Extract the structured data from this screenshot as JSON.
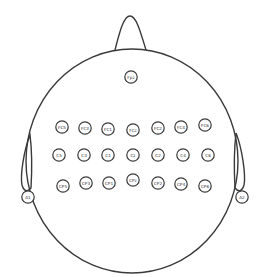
{
  "colors": {
    "stroke": "#3a3a3a",
    "background": "#ffffff"
  },
  "electrodes": [
    {
      "label": "Fpz",
      "x": 131,
      "y": 77
    },
    {
      "label": "FC5",
      "x": 62,
      "y": 127
    },
    {
      "label": "FC3",
      "x": 85,
      "y": 128
    },
    {
      "label": "FC1",
      "x": 108,
      "y": 129
    },
    {
      "label": "FCz",
      "x": 133,
      "y": 130
    },
    {
      "label": "FC2",
      "x": 158,
      "y": 128
    },
    {
      "label": "FC4",
      "x": 181,
      "y": 127
    },
    {
      "label": "FC6",
      "x": 205,
      "y": 125
    },
    {
      "label": "C5",
      "x": 59,
      "y": 155
    },
    {
      "label": "C3",
      "x": 84,
      "y": 155
    },
    {
      "label": "C1",
      "x": 108,
      "y": 155
    },
    {
      "label": "Cz",
      "x": 133,
      "y": 155
    },
    {
      "label": "C2",
      "x": 158,
      "y": 155
    },
    {
      "label": "C4",
      "x": 183,
      "y": 155
    },
    {
      "label": "C6",
      "x": 208,
      "y": 155
    },
    {
      "label": "CP5",
      "x": 63,
      "y": 186
    },
    {
      "label": "CP3",
      "x": 86,
      "y": 183
    },
    {
      "label": "CP1",
      "x": 109,
      "y": 183
    },
    {
      "label": "CPz",
      "x": 133,
      "y": 180
    },
    {
      "label": "CP2",
      "x": 158,
      "y": 183
    },
    {
      "label": "CP4",
      "x": 181,
      "y": 184
    },
    {
      "label": "CP6",
      "x": 205,
      "y": 186
    },
    {
      "label": "A1",
      "x": 28,
      "y": 197
    },
    {
      "label": "A2",
      "x": 242,
      "y": 197
    }
  ]
}
